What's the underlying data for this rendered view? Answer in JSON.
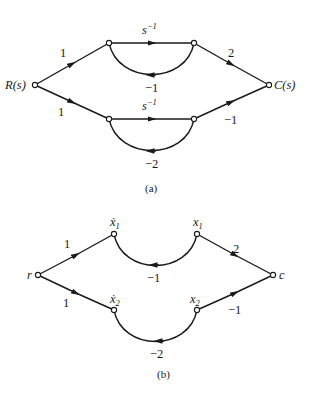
{
  "diagram_a": {
    "caption": "(a)",
    "nodes": {
      "input": "R(s)",
      "output": "C(s)"
    },
    "gains": {
      "r_to_top": "1",
      "r_to_bottom": "1",
      "top_forward_base": "s",
      "top_forward_exp": "−1",
      "top_feedback": "−1",
      "bottom_forward_base": "s",
      "bottom_forward_exp": "−1",
      "bottom_feedback": "−2",
      "top_to_c": "2",
      "bottom_to_c": "−1"
    }
  },
  "diagram_b": {
    "caption": "(b)",
    "nodes": {
      "input": "r",
      "output": "c",
      "x1dot": "ẋ",
      "x1dot_sub": "1",
      "x1": "x",
      "x1_sub": "1",
      "x2dot": "ẋ",
      "x2dot_sub": "2",
      "x2": "x",
      "x2_sub": "2"
    },
    "gains": {
      "r_to_top": "1",
      "r_to_bottom": "1",
      "top_feedback": "−1",
      "bottom_feedback": "−2",
      "top_to_c": "2",
      "bottom_to_c": "−1"
    }
  }
}
